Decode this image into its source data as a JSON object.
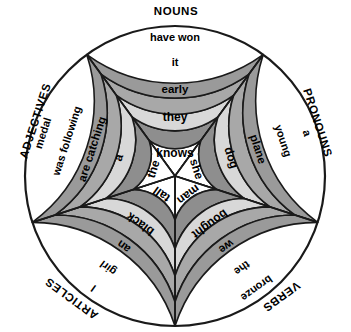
{
  "diagram": {
    "type": "concentric-sector-wheel",
    "center": {
      "x": 175,
      "y": 176
    },
    "sector_count": 5,
    "ring_count": 5,
    "radii": [
      0,
      44,
      73,
      100,
      126,
      150
    ],
    "ring_fills": [
      "#ffffff",
      "#8e8e8e",
      "#d8d8d8",
      "#a8a8a8",
      "#9a9a9a"
    ],
    "outline_color": "#1a1a1a",
    "background_color": "#ffffff"
  },
  "categories": [
    {
      "id": "nouns",
      "label": "NOUNS",
      "angle_deg": 90,
      "label_x": 176,
      "label_y": 12,
      "rotate": 0
    },
    {
      "id": "pronouns",
      "label": "PRONOUNS",
      "angle_deg": 18,
      "label_x": 317,
      "label_y": 123,
      "rotate": 72
    },
    {
      "id": "verbs",
      "label": "VERBS",
      "angle_deg": 306,
      "label_x": 281,
      "label_y": 296,
      "rotate": 144
    },
    {
      "id": "articles",
      "label": "ARTICLES",
      "angle_deg": 234,
      "label_x": 72,
      "label_y": 298,
      "rotate": 216
    },
    {
      "id": "adjectives",
      "label": "ADJECTIVES",
      "angle_deg": 162,
      "label_x": 36,
      "label_y": 121,
      "rotate": 288
    }
  ],
  "sectors": [
    {
      "id": "nouns",
      "label": "NOUNS",
      "angle_deg": 90,
      "words": [
        "knows",
        "they",
        "early",
        "it",
        "have won"
      ]
    },
    {
      "id": "pronouns",
      "label": "PRONOUNS",
      "angle_deg": 18,
      "words": [
        "she",
        "dog",
        "plane",
        "young",
        "a"
      ]
    },
    {
      "id": "verbs",
      "label": "VERBS",
      "angle_deg": 306,
      "words": [
        "man",
        "bought",
        "we",
        "the",
        "bronze"
      ]
    },
    {
      "id": "articles",
      "label": "ARTICLES",
      "angle_deg": 234,
      "words": [
        "tall",
        "black",
        "an",
        "girl",
        "I"
      ]
    },
    {
      "id": "adjectives",
      "label": "ADJECTIVES",
      "angle_deg": 162,
      "words": [
        "the",
        "a",
        "are catching",
        "was following",
        "medal"
      ]
    }
  ],
  "word_font_sizes": [
    12,
    12,
    11.5,
    11,
    11
  ]
}
